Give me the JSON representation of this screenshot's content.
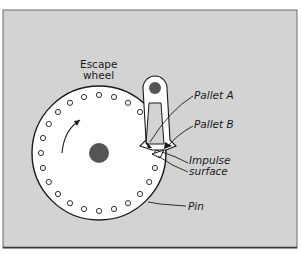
{
  "figure": {
    "type": "escapement mechanism diagram",
    "background_color": "#d4d4d4",
    "wheel_fill": "#ffffff",
    "line_color": "#1a1a1a",
    "hub_color": "#555555"
  },
  "labels": {
    "escape_wheel_line1": "Escape",
    "escape_wheel_line2": "wheel",
    "pallet_a": "Pallet A",
    "pallet_b": "Pallet B",
    "impulse_line1": "Impulse",
    "impulse_line2": "surface",
    "pin": "Pin"
  },
  "wheel": {
    "center": [
      99,
      153
    ],
    "radius": 67,
    "pin_count": 24,
    "pin_ring_radius": 58,
    "rotation": "counter-clockwise arrow (upward on left side)"
  }
}
